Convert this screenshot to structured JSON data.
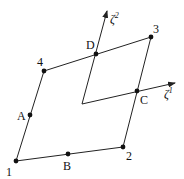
{
  "diagram": {
    "colors": {
      "stroke": "#222222",
      "node": "#111111",
      "background": "#ffffff"
    },
    "nodes": [
      {
        "id": "1",
        "label": "1",
        "x": 16,
        "y": 161,
        "lx": 6,
        "ly": 176
      },
      {
        "id": "2",
        "label": "2",
        "x": 123,
        "y": 147,
        "lx": 126,
        "ly": 160
      },
      {
        "id": "3",
        "label": "3",
        "x": 151,
        "y": 37,
        "lx": 153,
        "ly": 33
      },
      {
        "id": "4",
        "label": "4",
        "x": 44,
        "y": 71,
        "lx": 37,
        "ly": 66
      }
    ],
    "midpoints": [
      {
        "id": "A",
        "label": "A",
        "x": 30,
        "y": 115,
        "lx": 17,
        "ly": 120
      },
      {
        "id": "B",
        "label": "B",
        "x": 68,
        "y": 154,
        "lx": 63,
        "ly": 170
      },
      {
        "id": "C",
        "label": "C",
        "x": 137,
        "y": 91,
        "lx": 140,
        "ly": 104
      },
      {
        "id": "D",
        "label": "D",
        "x": 96,
        "y": 54,
        "lx": 86,
        "ly": 49
      }
    ],
    "axes": {
      "origin": {
        "x": 82,
        "y": 104
      },
      "zeta1": {
        "label": "ζ",
        "sup": "1",
        "tip_x": 175,
        "tip_y": 83,
        "lx": 164,
        "ly": 98
      },
      "zeta2": {
        "label": "ζ",
        "sup": "2",
        "tip_x": 107,
        "tip_y": 11,
        "lx": 110,
        "ly": 23
      }
    }
  }
}
